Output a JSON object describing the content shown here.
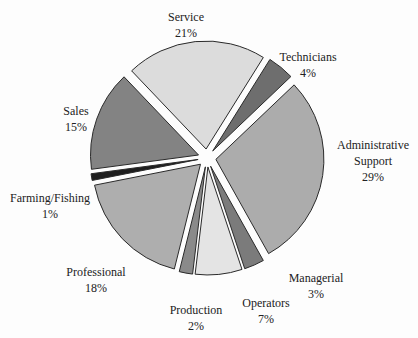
{
  "chart_data": {
    "type": "pie",
    "title": "",
    "exploded": true,
    "center": [
      207,
      158
    ],
    "radius": 108,
    "start_angle_deg": 32,
    "slices": [
      {
        "label": "Technicians",
        "pct_label": "4%",
        "value": 4,
        "color": "#6e6e6e",
        "label_pos": [
          262,
          55
        ]
      },
      {
        "label": "Administrative Support",
        "label_line1": "Administrative",
        "label_line2": "Support",
        "pct_label": "29%",
        "value": 29,
        "color": "#acacac",
        "label_pos": [
          373,
          143
        ]
      },
      {
        "label": "Managerial",
        "pct_label": "3%",
        "value": 3,
        "color": "#7b7b7b",
        "label_pos": [
          316,
          272
        ]
      },
      {
        "label": "Operators",
        "pct_label": "7%",
        "value": 7,
        "color": "#e4e4e4",
        "label_pos": [
          266,
          302
        ]
      },
      {
        "label": "Production",
        "pct_label": "2%",
        "value": 2,
        "color": "#8a8a8a",
        "label_pos": [
          196,
          306
        ]
      },
      {
        "label": "Professional",
        "pct_label": "18%",
        "value": 18,
        "color": "#aeaeae",
        "label_pos": [
          96,
          267
        ]
      },
      {
        "label": "Farming/Fishing",
        "pct_label": "1%",
        "value": 1,
        "color": "#1e1e1e",
        "label_pos": [
          50,
          196
        ]
      },
      {
        "label": "Sales",
        "pct_label": "15%",
        "value": 15,
        "color": "#838383",
        "label_pos": [
          72,
          105
        ]
      },
      {
        "label": "Service",
        "pct_label": "21%",
        "value": 21,
        "color": "#dcdcdc",
        "label_pos": [
          186,
          12
        ]
      }
    ]
  },
  "labels": {
    "service": {
      "name": "Service",
      "pct": "21%"
    },
    "technicians": {
      "name": "Technicians",
      "pct": "4%"
    },
    "admin": {
      "name1": "Administrative",
      "name2": "Support",
      "pct": "29%"
    },
    "sales": {
      "name": "Sales",
      "pct": "15%"
    },
    "farming": {
      "name": "Farming/Fishing",
      "pct": "1%"
    },
    "professional": {
      "name": "Professional",
      "pct": "18%"
    },
    "production": {
      "name": "Production",
      "pct": "2%"
    },
    "operators": {
      "name": "Operators",
      "pct": "7%"
    },
    "managerial": {
      "name": "Managerial",
      "pct": "3%"
    }
  }
}
